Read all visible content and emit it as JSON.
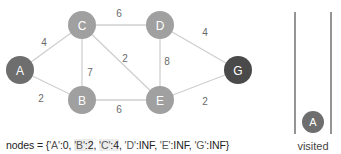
{
  "graph": {
    "nodes": [
      {
        "id": "A",
        "label": "A",
        "x": 20,
        "y": 70,
        "color": "#6e6e6e"
      },
      {
        "id": "C",
        "label": "C",
        "x": 82,
        "y": 25,
        "color": "#a0a0a0"
      },
      {
        "id": "D",
        "label": "D",
        "x": 160,
        "y": 25,
        "color": "#a0a0a0"
      },
      {
        "id": "B",
        "label": "B",
        "x": 82,
        "y": 100,
        "color": "#a0a0a0"
      },
      {
        "id": "E",
        "label": "E",
        "x": 160,
        "y": 100,
        "color": "#a0a0a0"
      },
      {
        "id": "G",
        "label": "G",
        "x": 238,
        "y": 70,
        "color": "#4a4a4a"
      }
    ],
    "edges": [
      {
        "from": "A",
        "to": "C",
        "weight": "4",
        "lx": 44,
        "ly": 46
      },
      {
        "from": "A",
        "to": "B",
        "weight": "2",
        "lx": 41,
        "ly": 102
      },
      {
        "from": "C",
        "to": "D",
        "weight": "6",
        "lx": 119,
        "ly": 17
      },
      {
        "from": "C",
        "to": "B",
        "weight": "7",
        "lx": 90,
        "ly": 76
      },
      {
        "from": "C",
        "to": "E",
        "weight": "2",
        "lx": 125,
        "ly": 62
      },
      {
        "from": "D",
        "to": "E",
        "weight": "8",
        "lx": 167,
        "ly": 65
      },
      {
        "from": "D",
        "to": "G",
        "weight": "4",
        "lx": 205,
        "ly": 36
      },
      {
        "from": "B",
        "to": "E",
        "weight": "6",
        "lx": 119,
        "ly": 113
      },
      {
        "from": "E",
        "to": "G",
        "weight": "2",
        "lx": 205,
        "ly": 105
      }
    ]
  },
  "visited": {
    "label": "visited",
    "items": [
      {
        "label": "A",
        "color": "#6e6e6e"
      }
    ]
  },
  "nodes_dict": {
    "prefix": "nodes = {",
    "entries": [
      {
        "key": "'A'",
        "value": "0",
        "highlight": false
      },
      {
        "key": "'B'",
        "value": "2",
        "highlight": true
      },
      {
        "key": "'C'",
        "value": "4",
        "highlight": true
      },
      {
        "key": "'D'",
        "value": "INF",
        "highlight": false
      },
      {
        "key": "'E'",
        "value": "INF",
        "highlight": false
      },
      {
        "key": "'G'",
        "value": "INF",
        "highlight": false
      }
    ],
    "suffix": "}"
  }
}
